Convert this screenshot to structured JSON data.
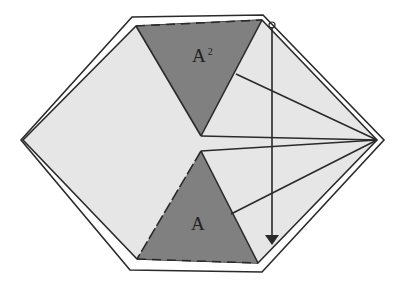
{
  "diagram": {
    "labels": {
      "top_triangle": "A",
      "top_triangle_superscript": "2",
      "bottom_triangle": "A"
    },
    "colors": {
      "background": "#ffffff",
      "hexagon_fill": "#e6e6e6",
      "triangle_fill": "#808080",
      "stroke": "#2a2a2a"
    }
  }
}
